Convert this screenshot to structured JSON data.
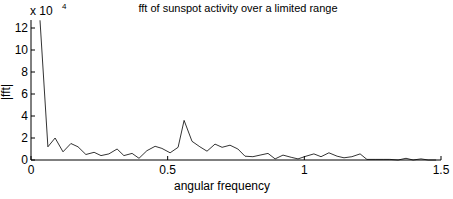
{
  "chart_data": {
    "type": "line",
    "title": "fft of sunspot activity over a limited range",
    "xlabel": "angular frequency",
    "ylabel": "|fft|",
    "y_multiplier": "x 10",
    "y_multiplier_exp": "4",
    "xlim": [
      0,
      1.5
    ],
    "ylim": [
      0,
      12.6
    ],
    "xticks": [
      0,
      0.5,
      1,
      1.5
    ],
    "xtick_labels": [
      "0",
      "0.5",
      "1",
      "1.5"
    ],
    "yticks": [
      0,
      2,
      4,
      6,
      8,
      10,
      12
    ],
    "ytick_labels": [
      "0",
      "2",
      "4",
      "6",
      "8",
      "10",
      "12"
    ],
    "grid": false,
    "line_color": "#000000",
    "series": [
      {
        "name": "|fft|",
        "x": [
          0.033,
          0.062,
          0.088,
          0.117,
          0.146,
          0.172,
          0.201,
          0.231,
          0.256,
          0.285,
          0.315,
          0.34,
          0.37,
          0.395,
          0.424,
          0.454,
          0.479,
          0.509,
          0.538,
          0.56,
          0.589,
          0.618,
          0.644,
          0.673,
          0.699,
          0.728,
          0.757,
          0.783,
          0.812,
          0.838,
          0.867,
          0.893,
          0.922,
          0.952,
          0.977,
          1.006,
          1.035,
          1.061,
          1.09,
          1.12,
          1.145,
          1.174,
          1.204,
          1.229,
          1.259,
          1.288,
          1.313,
          1.343,
          1.372,
          1.398,
          1.427,
          1.453,
          1.482
        ],
        "values": [
          12.7,
          1.2,
          2.0,
          0.75,
          1.5,
          1.2,
          0.5,
          0.7,
          0.4,
          0.55,
          1.0,
          0.4,
          0.6,
          0.15,
          0.85,
          1.25,
          1.05,
          0.65,
          1.15,
          3.6,
          1.7,
          1.2,
          0.8,
          1.45,
          1.15,
          1.35,
          1.0,
          0.35,
          0.3,
          0.45,
          0.6,
          0.1,
          0.45,
          0.25,
          0.1,
          0.35,
          0.55,
          0.3,
          0.65,
          0.35,
          0.2,
          0.3,
          0.55,
          0.05,
          0.05,
          0.05,
          0.05,
          0.0,
          0.15,
          0.0,
          0.1,
          0.0,
          0.0
        ]
      }
    ]
  }
}
